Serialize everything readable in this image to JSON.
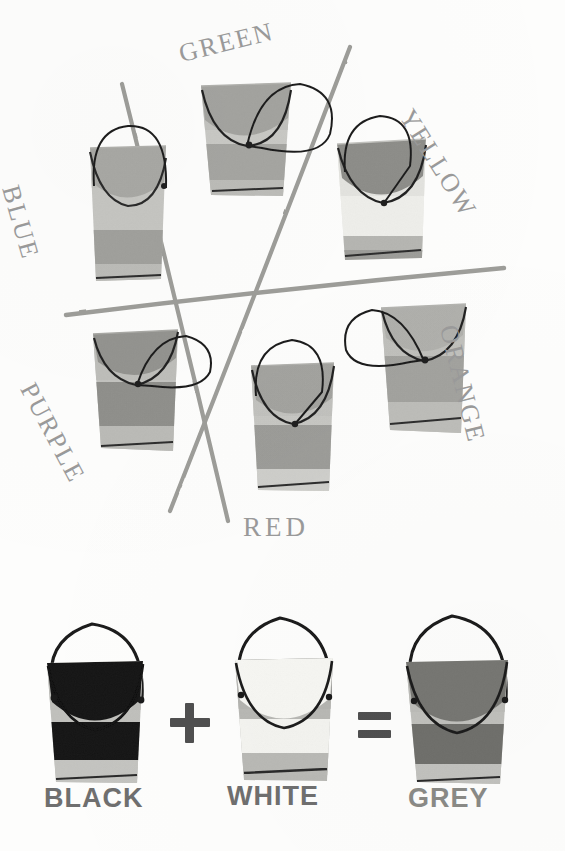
{
  "page": {
    "background_color": "#fdfdfc",
    "is_greyscale": true
  },
  "palette": {
    "line_grey": "#9a9a9a",
    "ink_black": "#1b1b1b",
    "label_grey": "#9a9a9a",
    "mix_label_grey": "#6f6f6f",
    "tone_lightest": "#f4f4f2",
    "tone_light": "#dcdcd8",
    "tone_mid_light": "#c9c9c5",
    "tone_mid": "#b4b4b0",
    "tone_mid_dark": "#9b9b97",
    "tone_dark": "#7e7e7a",
    "tone_black": "#171717",
    "tone_white": "#fbfbf9"
  },
  "wheel": {
    "labels": [
      {
        "name": "green",
        "text": "GREEN",
        "x": 176,
        "y": 40,
        "rotate": -16,
        "size": 26
      },
      {
        "name": "yellow",
        "text": "YELLOW",
        "x": 412,
        "y": 104,
        "rotate": 58,
        "size": 26
      },
      {
        "name": "orange",
        "text": "ORANGE",
        "x": 446,
        "y": 327,
        "rotate": 76,
        "size": 26
      },
      {
        "name": "red",
        "text": "RED",
        "x": 243,
        "y": 514,
        "rotate": 0,
        "size": 26
      },
      {
        "name": "purple",
        "text": "PURPLE",
        "x": 30,
        "y": 378,
        "rotate": 60,
        "size": 26
      },
      {
        "name": "blue",
        "text": "BLUE",
        "x": 12,
        "y": 182,
        "rotate": 74,
        "size": 26
      }
    ],
    "axis_lines": [
      {
        "name": "axis-green-red",
        "x1": 122,
        "y1": 84,
        "x2": 228,
        "y2": 520
      },
      {
        "name": "axis-yellow-purple",
        "x1": 349,
        "y1": 48,
        "x2": 171,
        "y2": 510
      },
      {
        "name": "axis-blue-orange",
        "x1": 66,
        "y1": 314,
        "x2": 503,
        "y2": 268
      }
    ],
    "buckets": [
      {
        "name": "bucket-blue",
        "label": "BLUE",
        "x": 88,
        "y": 145,
        "w": 80,
        "h": 135,
        "rotate": -3,
        "paint_tone": "#a8a8a4",
        "bands": [
          "#c6c6c2",
          "#c6c6c2",
          "#a0a09c",
          "#b9b9b5"
        ],
        "handle": "tall-loop"
      },
      {
        "name": "bucket-green",
        "label": "GREEN",
        "x": 199,
        "y": 83,
        "w": 93,
        "h": 113,
        "rotate": 2,
        "paint_tone": "#a3a39f",
        "bands": [
          "#c9c9c5",
          "#c0c0bc",
          "#a5a5a1",
          "#bcbcb8"
        ],
        "handle": "side-loop-right"
      },
      {
        "name": "bucket-yellow",
        "label": "YELLOW",
        "x": 335,
        "y": 139,
        "w": 92,
        "h": 120,
        "rotate": -2,
        "paint_tone": "#8d8d89",
        "bands": [
          "#e9e9e5",
          "#efefeb",
          "#b6b6b2",
          "#9d9d99"
        ],
        "handle": "tall-loop"
      },
      {
        "name": "bucket-orange",
        "label": "ORANGE",
        "x": 378,
        "y": 304,
        "w": 90,
        "h": 130,
        "rotate": 3,
        "paint_tone": "#b0b0ac",
        "bands": [
          "#c6c6c2",
          "#bfbfbb",
          "#a2a29e",
          "#bdbdb9"
        ],
        "handle": "side-loop-left"
      },
      {
        "name": "bucket-red",
        "label": "RED",
        "x": 249,
        "y": 362,
        "w": 87,
        "h": 130,
        "rotate": 0,
        "paint_tone": "#a3a39f",
        "bands": [
          "#c7c7c3",
          "#c2c2be",
          "#9c9c98",
          "#cfcfcb"
        ],
        "handle": "tall-loop"
      },
      {
        "name": "bucket-purple",
        "label": "PURPLE",
        "x": 91,
        "y": 330,
        "w": 88,
        "h": 122,
        "rotate": 2,
        "paint_tone": "#93938f",
        "bands": [
          "#c3c3bf",
          "#bebeba",
          "#8f8f8b",
          "#bbbbb7"
        ],
        "handle": "side-loop-right"
      }
    ]
  },
  "mix_row": {
    "equation_text": "BLACK + WHITE = GREY",
    "operators": [
      {
        "name": "plus-sign",
        "symbol": "+",
        "x": 172,
        "y": 700,
        "size": 54
      },
      {
        "name": "equals-sign",
        "symbol": "=",
        "x": 352,
        "y": 700,
        "size": 54
      }
    ],
    "buckets": [
      {
        "name": "bucket-black",
        "label": "BLACK",
        "label_x": 44,
        "label_y": 784,
        "x": 40,
        "y": 640,
        "w": 108,
        "h": 145,
        "paint_tone": "#151515",
        "bands": [
          "#c0c0bc",
          "#bcbcb8",
          "#151515",
          "#c4c4c0"
        ],
        "handle": "big-round-loop"
      },
      {
        "name": "bucket-white",
        "label": "WHITE",
        "label_x": 222,
        "label_y": 784,
        "x": 228,
        "y": 640,
        "w": 106,
        "h": 145,
        "paint_tone": "#f7f7f3",
        "bands": [
          "#b8b8b4",
          "#b4b4b0",
          "#f4f4f0",
          "#b9b9b5"
        ],
        "handle": "big-round-loop"
      },
      {
        "name": "bucket-grey",
        "label": "GREY",
        "label_x": 406,
        "label_y": 784,
        "x": 400,
        "y": 640,
        "w": 112,
        "h": 145,
        "paint_tone": "#767672",
        "bands": [
          "#c0c0bc",
          "#bcbcb8",
          "#6f6f6b",
          "#c2c2be"
        ],
        "handle": "big-round-loop"
      }
    ]
  }
}
